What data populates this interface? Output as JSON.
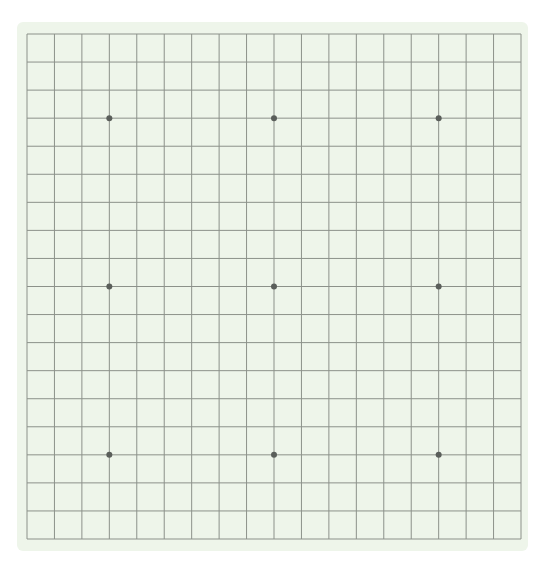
{
  "game": {
    "type": "go",
    "board_size": 19,
    "stones": [],
    "star_points": [
      [
        3,
        3
      ],
      [
        3,
        9
      ],
      [
        3,
        15
      ],
      [
        9,
        3
      ],
      [
        9,
        9
      ],
      [
        9,
        15
      ],
      [
        15,
        3
      ],
      [
        15,
        9
      ],
      [
        15,
        15
      ]
    ]
  },
  "colors": {
    "board_background": "#eef5ea",
    "grid_line": "#8c918a",
    "star_point": "#5a5e5a"
  },
  "layout": {
    "board": {
      "x": 17,
      "y": 22,
      "width": 511,
      "height": 529
    },
    "grid": {
      "x0": 27,
      "y0": 34,
      "x1": 521,
      "y1": 539
    }
  }
}
